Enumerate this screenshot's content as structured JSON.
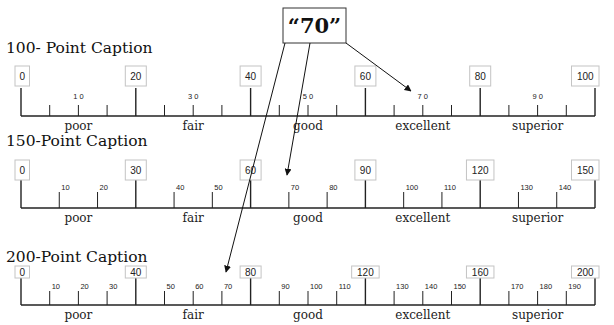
{
  "callout": {
    "label": "“70”",
    "value": 70
  },
  "scales": [
    {
      "title": "100- Point Caption",
      "max": 100,
      "major_step": 20,
      "minor_step": 5,
      "minor_labels": [
        "1 0",
        "3 0",
        "5 0",
        "7 0",
        "9 0"
      ],
      "minor_label_values": [
        10,
        30,
        50,
        70,
        90
      ],
      "major_labels": [
        "0",
        "20",
        "40",
        "60",
        "80",
        "100"
      ],
      "categories": [
        "poor",
        "fair",
        "good",
        "excellent",
        "superior"
      ]
    },
    {
      "title": "150-Point Caption",
      "max": 150,
      "major_step": 30,
      "minor_step": 10,
      "minor_labels": [
        "10",
        "20",
        "40",
        "50",
        "70",
        "80",
        "100",
        "110",
        "130",
        "140"
      ],
      "minor_label_values": [
        10,
        20,
        40,
        50,
        70,
        80,
        100,
        110,
        130,
        140
      ],
      "major_labels": [
        "0",
        "30",
        "60",
        "90",
        "120",
        "150"
      ],
      "categories": [
        "poor",
        "fair",
        "good",
        "excellent",
        "superior"
      ]
    },
    {
      "title": "200-Point Caption",
      "max": 200,
      "major_step": 40,
      "minor_step": 10,
      "minor_labels": [
        "10",
        "20",
        "30",
        "50",
        "60",
        "70",
        "90",
        "100",
        "110",
        "130",
        "140",
        "150",
        "170",
        "180",
        "190"
      ],
      "minor_label_values": [
        10,
        20,
        30,
        50,
        60,
        70,
        90,
        100,
        110,
        130,
        140,
        150,
        170,
        180,
        190
      ],
      "major_labels": [
        "0",
        "40",
        "80",
        "120",
        "160",
        "200"
      ],
      "categories": [
        "poor",
        "fair",
        "good",
        "excellent",
        "superior"
      ]
    }
  ],
  "colors": {
    "line": "#222222",
    "box_border": "#bfbfbf",
    "text": "#111111"
  }
}
